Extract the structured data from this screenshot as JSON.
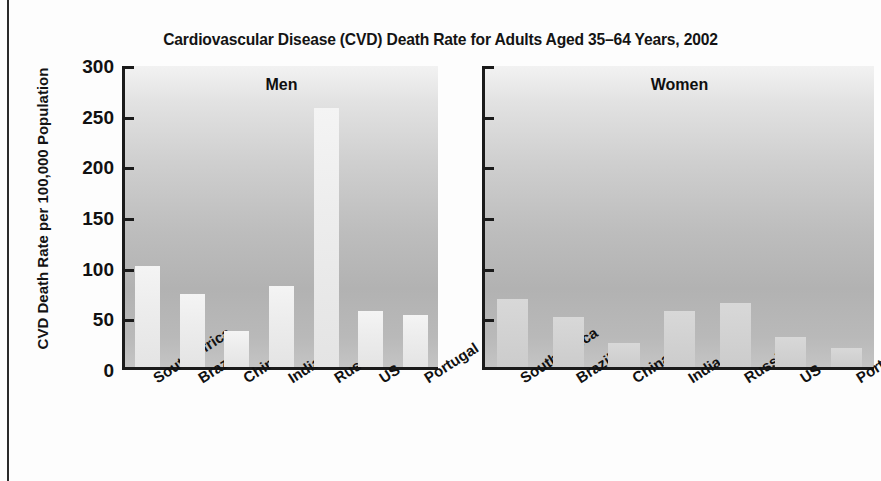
{
  "chart_data": {
    "type": "bar",
    "title": "Cardiovascular Disease (CVD) Death Rate for Adults Aged 35–64 Years, 2002",
    "xlabel": "",
    "ylabel": "CVD Death Rate per 100,000 Population",
    "ylim": [
      0,
      300
    ],
    "ytick_labels": [
      "300",
      "250",
      "200",
      "150",
      "100",
      "50",
      "0"
    ],
    "ytick_values": [
      300,
      250,
      200,
      150,
      100,
      50,
      0
    ],
    "grid": false,
    "legend": "none",
    "categories": [
      "South Africa",
      "Brazil",
      "China",
      "India",
      "Russia",
      "US",
      "Portugal"
    ],
    "panels": [
      {
        "name": "men",
        "label": "Men",
        "values": [
          100,
          72,
          36,
          80,
          256,
          55,
          51
        ]
      },
      {
        "name": "women",
        "label": "Women",
        "values": [
          67,
          49,
          24,
          55,
          63,
          30,
          19
        ]
      }
    ],
    "series": [
      {
        "name": "Men",
        "values": [
          100,
          72,
          36,
          80,
          256,
          55,
          51
        ]
      },
      {
        "name": "Women",
        "values": [
          67,
          49,
          24,
          55,
          63,
          30,
          19
        ]
      }
    ],
    "colors": {
      "bar_men": "#efefef",
      "bar_women": "#d4d4d4",
      "axis": "#1a1a1a",
      "text": "#111111",
      "panel_background_top": "#f2f2f2",
      "panel_background_mid": "#b6b6b6",
      "page_background": "#fdfdfd"
    }
  }
}
